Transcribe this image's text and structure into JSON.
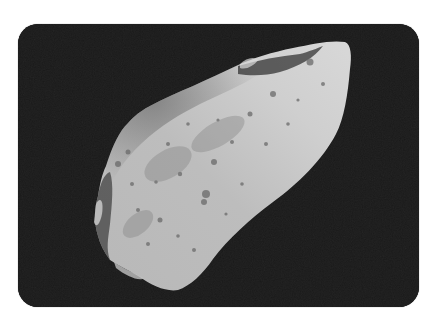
{
  "image": {
    "subject": "asteroid",
    "description": "Grayscale spacecraft photograph of an elongated, cratered asteroid against black space",
    "alt": "Cratered asteroid in space",
    "colors": {
      "page_background": "#ffffff",
      "space_background": "#1a1a1a",
      "asteroid_light": "#c8c8c8",
      "asteroid_mid": "#9a9a9a",
      "asteroid_shadow": "#4a4a4a"
    },
    "frame": {
      "corner_radius_px": 20
    }
  }
}
